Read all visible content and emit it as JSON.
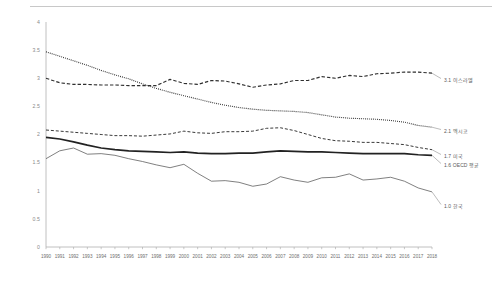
{
  "chart_data": {
    "type": "line",
    "title": "",
    "subtitle": "",
    "xlabel": "",
    "ylabel": "",
    "xlim": [
      1990,
      2018
    ],
    "ylim": [
      0,
      4
    ],
    "yticks": [
      "0",
      "0.5",
      "1",
      "1.5",
      "2",
      "2.5",
      "3",
      "3.5",
      "4"
    ],
    "ytick_values": [
      0,
      0.5,
      1,
      1.5,
      2,
      2.5,
      3,
      3.5,
      4
    ],
    "grid": false,
    "legend_position": "right-inline-labels",
    "x": [
      1990,
      1991,
      1992,
      1993,
      1994,
      1995,
      1996,
      1997,
      1998,
      1999,
      2000,
      2001,
      2002,
      2003,
      2004,
      2005,
      2006,
      2007,
      2008,
      2009,
      2010,
      2011,
      2012,
      2013,
      2014,
      2015,
      2016,
      2017,
      2018
    ],
    "categories": [
      "1990",
      "1991",
      "1992",
      "1993",
      "1994",
      "1995",
      "1996",
      "1997",
      "1998",
      "1999",
      "2000",
      "2001",
      "2002",
      "2003",
      "2004",
      "2005",
      "2006",
      "2007",
      "2008",
      "2009",
      "2010",
      "2011",
      "2012",
      "2013",
      "2014",
      "2015",
      "2016",
      "2017",
      "2018"
    ],
    "series": [
      {
        "name": "이스라엘",
        "end_label": "3.1 이스라엘",
        "end_value": "3.1",
        "style": "dashed",
        "values": [
          3.0,
          2.92,
          2.89,
          2.89,
          2.88,
          2.88,
          2.87,
          2.87,
          2.87,
          2.98,
          2.91,
          2.89,
          2.96,
          2.95,
          2.9,
          2.84,
          2.88,
          2.9,
          2.96,
          2.96,
          3.03,
          3.0,
          3.05,
          3.03,
          3.08,
          3.09,
          3.11,
          3.11,
          3.09
        ]
      },
      {
        "name": "멕시코",
        "end_label": "2.1 멕시코",
        "end_value": "2.1",
        "style": "dotted",
        "values": [
          3.47,
          3.39,
          3.31,
          3.23,
          3.14,
          3.06,
          2.99,
          2.9,
          2.82,
          2.75,
          2.69,
          2.63,
          2.57,
          2.52,
          2.48,
          2.45,
          2.43,
          2.42,
          2.41,
          2.39,
          2.35,
          2.31,
          2.29,
          2.28,
          2.27,
          2.25,
          2.22,
          2.16,
          2.13
        ]
      },
      {
        "name": "미국",
        "end_label": "1.7 미국",
        "end_value": "1.7",
        "style": "dashed-thin",
        "values": [
          2.08,
          2.06,
          2.04,
          2.02,
          2.0,
          1.98,
          1.98,
          1.97,
          1.99,
          2.01,
          2.06,
          2.03,
          2.02,
          2.05,
          2.05,
          2.06,
          2.11,
          2.12,
          2.07,
          2.0,
          1.93,
          1.89,
          1.88,
          1.86,
          1.86,
          1.84,
          1.82,
          1.77,
          1.73
        ]
      },
      {
        "name": "OECD 평균",
        "end_label": "1.6 OECD 평균",
        "end_value": "1.6",
        "style": "solid-thick",
        "values": [
          1.95,
          1.92,
          1.87,
          1.81,
          1.76,
          1.73,
          1.71,
          1.7,
          1.69,
          1.68,
          1.69,
          1.67,
          1.66,
          1.66,
          1.67,
          1.67,
          1.69,
          1.71,
          1.7,
          1.69,
          1.69,
          1.68,
          1.67,
          1.66,
          1.66,
          1.66,
          1.66,
          1.64,
          1.63
        ]
      },
      {
        "name": "한국",
        "end_label": "1.0 한국",
        "end_value": "1.0",
        "style": "solid-thin",
        "values": [
          1.57,
          1.71,
          1.76,
          1.65,
          1.66,
          1.63,
          1.57,
          1.52,
          1.46,
          1.41,
          1.47,
          1.31,
          1.17,
          1.18,
          1.15,
          1.08,
          1.12,
          1.25,
          1.19,
          1.15,
          1.23,
          1.24,
          1.3,
          1.19,
          1.21,
          1.24,
          1.17,
          1.05,
          0.98
        ]
      }
    ],
    "annotations": [
      {
        "text": "3.1 이스라엘",
        "series": "이스라엘"
      },
      {
        "text": "2.1 멕시코",
        "series": "멕시코"
      },
      {
        "text": "1.7 미국",
        "series": "미국"
      },
      {
        "text": "1.6 OECD 평균",
        "series": "OECD 평균"
      },
      {
        "text": "1.0 한국",
        "series": "한국"
      }
    ]
  },
  "colors": {
    "axis": "#b0b0b0",
    "tick_text": "#8a8a8a",
    "line": "#3a3a3a",
    "rule": "#c8c8c8"
  }
}
